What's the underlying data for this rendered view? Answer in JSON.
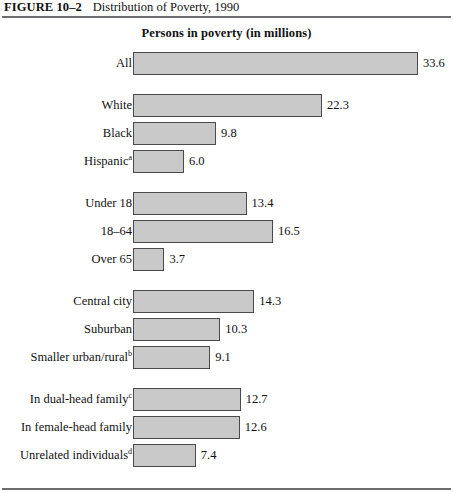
{
  "figure": {
    "number": "FIGURE 10–2",
    "caption": "Distribution of Poverty, 1990"
  },
  "chart_data": {
    "type": "bar",
    "orientation": "horizontal",
    "title": "Persons in poverty (in millions)",
    "xlabel": "",
    "ylabel": "",
    "xlim": [
      0,
      33.6
    ],
    "grid": false,
    "legend": null,
    "value_labels": true,
    "units": "millions of persons",
    "axis_scale_px_per_unit": 8.48,
    "groups": [
      {
        "name": "total",
        "categories": [
          "All"
        ],
        "values": [
          33.6
        ],
        "value_labels": [
          "33.6"
        ],
        "footnotes": [
          ""
        ]
      },
      {
        "name": "race-ethnicity",
        "categories": [
          "White",
          "Black",
          "Hispanic"
        ],
        "values": [
          22.3,
          9.8,
          6.0
        ],
        "value_labels": [
          "22.3",
          "9.8",
          "6.0"
        ],
        "footnotes": [
          "",
          "",
          "a"
        ]
      },
      {
        "name": "age",
        "categories": [
          "Under 18",
          "18–64",
          "Over 65"
        ],
        "values": [
          13.4,
          16.5,
          3.7
        ],
        "value_labels": [
          "13.4",
          "16.5",
          "3.7"
        ],
        "footnotes": [
          "",
          "",
          ""
        ]
      },
      {
        "name": "residence",
        "categories": [
          "Central city",
          "Suburban",
          "Smaller urban/rural"
        ],
        "values": [
          14.3,
          10.3,
          9.1
        ],
        "value_labels": [
          "14.3",
          "10.3",
          "9.1"
        ],
        "footnotes": [
          "",
          "",
          "b"
        ]
      },
      {
        "name": "household-type",
        "categories": [
          "In dual-head family",
          "In female-head family",
          "Unrelated individuals"
        ],
        "values": [
          12.7,
          12.6,
          7.4
        ],
        "value_labels": [
          "12.7",
          "12.6",
          "7.4"
        ],
        "footnotes": [
          "c",
          "",
          "d"
        ]
      }
    ],
    "colors": {
      "bar_fill": "#c9c9c9",
      "bar_border": "#4a4a4a",
      "rule": "#6d6d70",
      "text": "#111111",
      "background": "#ffffff"
    }
  }
}
